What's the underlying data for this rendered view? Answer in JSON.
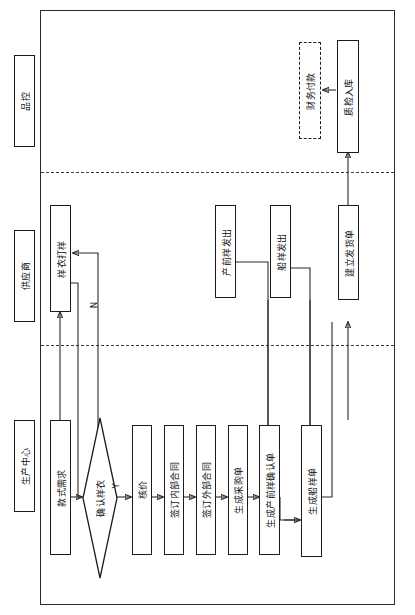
{
  "diagram": {
    "orientation": "rotated-90",
    "lanes": [
      {
        "id": "quality",
        "label": "品控"
      },
      {
        "id": "supplier",
        "label": "供应商"
      },
      {
        "id": "production",
        "label": "生产中心"
      }
    ],
    "nodes": [
      {
        "id": "style-demand",
        "lane": "production",
        "shape": "rect",
        "label": "款式需求"
      },
      {
        "id": "confirm-sample",
        "lane": "production",
        "shape": "diamond",
        "label": "确认样衣"
      },
      {
        "id": "price-review",
        "lane": "production",
        "shape": "rect",
        "label": "核价"
      },
      {
        "id": "sign-internal",
        "lane": "production",
        "shape": "rect",
        "label": "签订内部合同"
      },
      {
        "id": "sign-external",
        "lane": "production",
        "shape": "rect",
        "label": "签订外部合同"
      },
      {
        "id": "gen-purchase-order",
        "lane": "production",
        "shape": "rect",
        "label": "生成采购单"
      },
      {
        "id": "gen-preprod-confirm",
        "lane": "production",
        "shape": "rect",
        "label": "生成产前样确认单"
      },
      {
        "id": "gen-ship-sample",
        "lane": "production",
        "shape": "rect",
        "label": "生成船样单"
      },
      {
        "id": "sample-making",
        "lane": "supplier",
        "shape": "rect",
        "label": "样衣打样"
      },
      {
        "id": "preprod-sent",
        "lane": "supplier",
        "shape": "rect",
        "label": "产前样发出"
      },
      {
        "id": "ship-sample-sent",
        "lane": "supplier",
        "shape": "rect",
        "label": "船样发出"
      },
      {
        "id": "create-delivery",
        "lane": "supplier",
        "shape": "rect",
        "label": "建立发货单"
      },
      {
        "id": "finance-payment",
        "lane": "quality",
        "shape": "rect-dashed",
        "label": "财务付款"
      },
      {
        "id": "qc-warehousing",
        "lane": "quality",
        "shape": "rect",
        "label": "质检入库"
      }
    ],
    "edge_labels": {
      "yes": "Y",
      "no": "N"
    },
    "colors": {
      "stroke": "#1c1c1c",
      "divider": "#3a3a3a",
      "background": "#ffffff",
      "text": "#111111"
    }
  }
}
